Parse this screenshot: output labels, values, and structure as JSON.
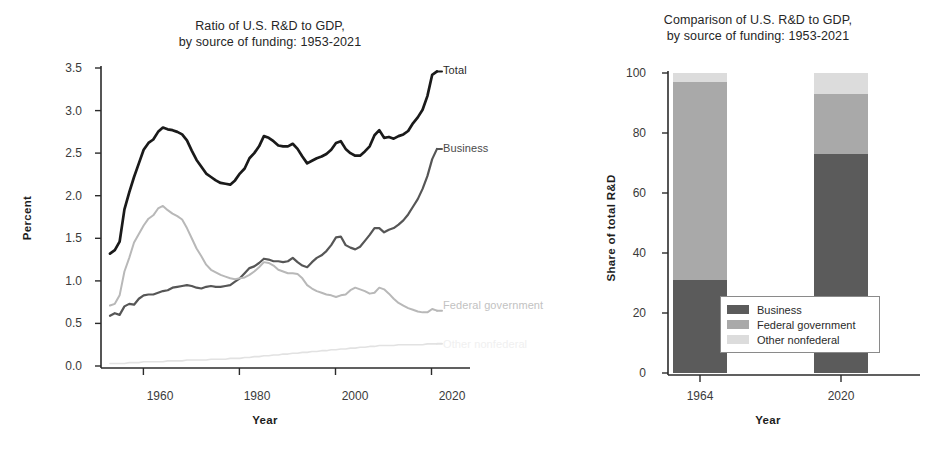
{
  "chart_data": [
    {
      "id": "line-chart",
      "type": "line",
      "title": "Ratio of U.S. R&D to GDP,\nby source of funding: 1953-2021",
      "title_line1": "Ratio of U.S. R&D to GDP,",
      "title_line2": "by source of funding: 1953-2021",
      "xlabel": "Year",
      "ylabel": "Percent",
      "xlim": [
        1953,
        2021
      ],
      "ylim": [
        0.0,
        3.5
      ],
      "xticks": [
        1960,
        1980,
        2000,
        2020
      ],
      "xtick_labels": [
        "1960",
        "1980",
        "2000",
        "2020"
      ],
      "yticks": [
        0.0,
        0.5,
        1.0,
        1.5,
        2.0,
        2.5,
        3.0,
        3.5
      ],
      "ytick_labels": [
        "0.0",
        "0.5",
        "1.0",
        "1.5",
        "2.0",
        "2.5",
        "3.0",
        "3.5"
      ],
      "grid": false,
      "legend_position": "inline-right-of-line-ends",
      "x": [
        1953,
        1954,
        1955,
        1956,
        1957,
        1958,
        1959,
        1960,
        1961,
        1962,
        1963,
        1964,
        1965,
        1966,
        1967,
        1968,
        1969,
        1970,
        1971,
        1972,
        1973,
        1974,
        1975,
        1976,
        1977,
        1978,
        1979,
        1980,
        1981,
        1982,
        1983,
        1984,
        1985,
        1986,
        1987,
        1988,
        1989,
        1990,
        1991,
        1992,
        1993,
        1994,
        1995,
        1996,
        1997,
        1998,
        1999,
        2000,
        2001,
        2002,
        2003,
        2004,
        2005,
        2006,
        2007,
        2008,
        2009,
        2010,
        2011,
        2012,
        2013,
        2014,
        2015,
        2016,
        2017,
        2018,
        2019,
        2020,
        2021
      ],
      "series": [
        {
          "name": "Total",
          "color": "#1a1a1a",
          "values": [
            1.32,
            1.36,
            1.46,
            1.84,
            2.04,
            2.22,
            2.38,
            2.54,
            2.62,
            2.66,
            2.75,
            2.8,
            2.78,
            2.77,
            2.75,
            2.72,
            2.65,
            2.53,
            2.42,
            2.34,
            2.26,
            2.22,
            2.18,
            2.15,
            2.14,
            2.13,
            2.18,
            2.26,
            2.32,
            2.44,
            2.5,
            2.58,
            2.7,
            2.68,
            2.64,
            2.59,
            2.58,
            2.58,
            2.61,
            2.55,
            2.46,
            2.38,
            2.41,
            2.44,
            2.46,
            2.49,
            2.54,
            2.62,
            2.64,
            2.55,
            2.5,
            2.47,
            2.47,
            2.52,
            2.58,
            2.71,
            2.77,
            2.68,
            2.69,
            2.67,
            2.7,
            2.72,
            2.76,
            2.85,
            2.92,
            3.01,
            3.17,
            3.42,
            3.46
          ]
        },
        {
          "name": "Business",
          "color": "#565656",
          "values": [
            0.59,
            0.62,
            0.6,
            0.7,
            0.73,
            0.72,
            0.79,
            0.83,
            0.84,
            0.84,
            0.86,
            0.88,
            0.89,
            0.92,
            0.93,
            0.94,
            0.95,
            0.94,
            0.92,
            0.91,
            0.93,
            0.94,
            0.93,
            0.93,
            0.94,
            0.95,
            0.99,
            1.03,
            1.09,
            1.15,
            1.17,
            1.21,
            1.26,
            1.25,
            1.23,
            1.23,
            1.22,
            1.23,
            1.27,
            1.22,
            1.18,
            1.16,
            1.22,
            1.27,
            1.3,
            1.35,
            1.42,
            1.51,
            1.52,
            1.42,
            1.39,
            1.37,
            1.4,
            1.47,
            1.54,
            1.62,
            1.62,
            1.57,
            1.6,
            1.62,
            1.66,
            1.71,
            1.78,
            1.87,
            1.96,
            2.08,
            2.23,
            2.43,
            2.55
          ]
        },
        {
          "name": "Federal government",
          "color": "#b8b8b8",
          "values": [
            0.71,
            0.73,
            0.83,
            1.11,
            1.27,
            1.45,
            1.55,
            1.65,
            1.73,
            1.77,
            1.85,
            1.88,
            1.83,
            1.79,
            1.76,
            1.72,
            1.62,
            1.5,
            1.38,
            1.29,
            1.19,
            1.13,
            1.1,
            1.07,
            1.05,
            1.03,
            1.02,
            1.03,
            1.04,
            1.07,
            1.11,
            1.16,
            1.22,
            1.21,
            1.18,
            1.13,
            1.11,
            1.09,
            1.09,
            1.08,
            1.03,
            0.95,
            0.91,
            0.88,
            0.86,
            0.84,
            0.83,
            0.81,
            0.83,
            0.84,
            0.89,
            0.92,
            0.9,
            0.88,
            0.85,
            0.86,
            0.92,
            0.9,
            0.85,
            0.79,
            0.74,
            0.71,
            0.68,
            0.66,
            0.64,
            0.63,
            0.63,
            0.67,
            0.65
          ]
        },
        {
          "name": "Other nonfederal",
          "color": "#e2e2e2",
          "values": [
            0.03,
            0.03,
            0.03,
            0.03,
            0.04,
            0.04,
            0.04,
            0.05,
            0.05,
            0.05,
            0.05,
            0.05,
            0.06,
            0.06,
            0.06,
            0.06,
            0.07,
            0.07,
            0.07,
            0.07,
            0.07,
            0.08,
            0.08,
            0.08,
            0.08,
            0.09,
            0.09,
            0.09,
            0.1,
            0.1,
            0.11,
            0.11,
            0.12,
            0.12,
            0.13,
            0.13,
            0.14,
            0.14,
            0.15,
            0.15,
            0.16,
            0.16,
            0.17,
            0.17,
            0.18,
            0.18,
            0.19,
            0.19,
            0.2,
            0.2,
            0.21,
            0.21,
            0.22,
            0.22,
            0.23,
            0.23,
            0.24,
            0.24,
            0.24,
            0.24,
            0.25,
            0.25,
            0.25,
            0.25,
            0.25,
            0.25,
            0.26,
            0.26,
            0.26
          ]
        }
      ],
      "annotations": [
        {
          "text": "Total",
          "series": "Total"
        },
        {
          "text": "Business",
          "series": "Business"
        },
        {
          "text": "Federal government",
          "series": "Federal government"
        },
        {
          "text": "Other nonfederal",
          "series": "Other nonfederal"
        }
      ]
    },
    {
      "id": "bar-chart",
      "type": "bar",
      "subtype": "stacked",
      "title_line1": "Comparison of U.S. R&D to GDP,",
      "title_line2": "by source of funding: 1953-2021",
      "xlabel": "Year",
      "ylabel": "Share of total R&D",
      "ylim": [
        0,
        100
      ],
      "yticks": [
        0,
        20,
        40,
        60,
        80,
        100
      ],
      "ytick_labels": [
        "0",
        "20",
        "40",
        "60",
        "80",
        "100"
      ],
      "categories": [
        "1964",
        "2020"
      ],
      "grid": false,
      "legend_position": "inside-bottom-center",
      "series": [
        {
          "name": "Business",
          "color": "#5b5b5b",
          "values": [
            31,
            73
          ]
        },
        {
          "name": "Federal government",
          "color": "#a9a9a9",
          "values": [
            66,
            20
          ]
        },
        {
          "name": "Other nonfederal",
          "color": "#dcdcdc",
          "values": [
            3,
            7
          ]
        }
      ]
    }
  ],
  "line_chart_ui": {
    "title_line1": "Ratio of U.S. R&D to GDP,",
    "title_line2": "by source of funding: 1953-2021",
    "ylabel": "Percent",
    "xlabel": "Year",
    "ytick_labels": [
      "3.5",
      "3.0",
      "2.5",
      "2.0",
      "1.5",
      "1.0",
      "0.5",
      "0.0"
    ],
    "xtick_labels": [
      "1960",
      "1980",
      "2000",
      "2020"
    ],
    "series_labels": {
      "total": "Total",
      "business": "Business",
      "federal": "Federal government",
      "other": "Other nonfederal"
    }
  },
  "bar_chart_ui": {
    "title_line1": "Comparison of U.S. R&D to GDP,",
    "title_line2": "by source of funding: 1953-2021",
    "ylabel": "Share of total R&D",
    "xlabel": "Year",
    "ytick_labels": [
      "100",
      "80",
      "60",
      "40",
      "20",
      "0"
    ],
    "xtick_labels": [
      "1964",
      "2020"
    ],
    "legend": {
      "business": "Business",
      "federal": "Federal government",
      "other": "Other nonfederal"
    }
  },
  "colors": {
    "total": "#1a1a1a",
    "business_line": "#565656",
    "federal_line": "#b8b8b8",
    "other_line": "#e2e2e2",
    "business_bar": "#5b5b5b",
    "federal_bar": "#a9a9a9",
    "other_bar": "#dcdcdc",
    "axis": "#2b2b2b"
  }
}
